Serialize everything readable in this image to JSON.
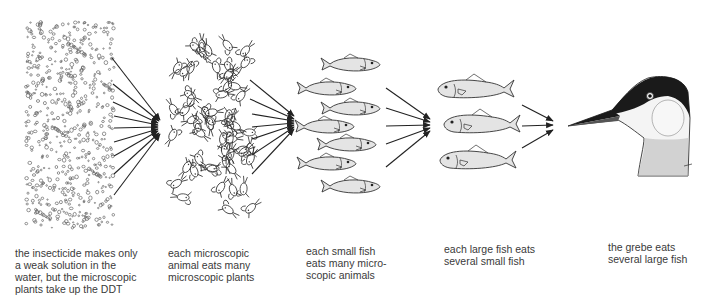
{
  "stages": [
    {
      "id": "plants",
      "name": "microscopic plants",
      "caption": "the insecticide makes only\na weak solution in the\nwater, but the microscopic\nplants take up the DDT"
    },
    {
      "id": "animals",
      "name": "microscopic animals",
      "caption": "each microscopic\nanimal eats many\nmicroscopic plants"
    },
    {
      "id": "small_fish",
      "name": "small fish",
      "caption": "each small fish\neats many micro-\nscopic animals"
    },
    {
      "id": "large_fish",
      "name": "large fish",
      "caption": "each large fish eats\nseveral small fish"
    },
    {
      "id": "grebe",
      "name": "grebe",
      "caption": "the grebe eats\nseveral large fish"
    }
  ],
  "arrow_groups": [
    {
      "from": "plants",
      "to": "animals",
      "count": 9
    },
    {
      "from": "animals",
      "to": "small_fish",
      "count": 7
    },
    {
      "from": "small_fish",
      "to": "large_fish",
      "count": 5
    },
    {
      "from": "large_fish",
      "to": "grebe",
      "count": 3
    }
  ],
  "colors": {
    "ink": "#222222",
    "fish_fill": "#e4e4e4",
    "grebe_cap": "#1a1a1a",
    "background": "#ffffff"
  }
}
